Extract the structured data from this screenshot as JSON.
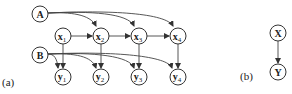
{
  "panels": [
    {
      "id": "a",
      "label": "(a)"
    },
    {
      "id": "b",
      "label": "(b)"
    }
  ],
  "nodes": {
    "A": {
      "text": "A",
      "sub": ""
    },
    "B": {
      "text": "B",
      "sub": ""
    },
    "x1": {
      "text": "x",
      "sub": "1"
    },
    "x2": {
      "text": "x",
      "sub": "2"
    },
    "x3": {
      "text": "x",
      "sub": "3"
    },
    "x4": {
      "text": "x",
      "sub": "4"
    },
    "y1": {
      "text": "y",
      "sub": "1"
    },
    "y2": {
      "text": "y",
      "sub": "2"
    },
    "y3": {
      "text": "y",
      "sub": "3"
    },
    "y4": {
      "text": "y",
      "sub": "4"
    },
    "X": {
      "text": "X",
      "sub": ""
    },
    "Y": {
      "text": "Y",
      "sub": ""
    }
  },
  "edges": [
    [
      "A",
      "x2"
    ],
    [
      "A",
      "x3"
    ],
    [
      "A",
      "x4"
    ],
    [
      "x1",
      "x2"
    ],
    [
      "x2",
      "x3"
    ],
    [
      "x3",
      "x4"
    ],
    [
      "x1",
      "y1"
    ],
    [
      "x2",
      "y2"
    ],
    [
      "x3",
      "y3"
    ],
    [
      "x4",
      "y4"
    ],
    [
      "B",
      "y1"
    ],
    [
      "B",
      "y2"
    ],
    [
      "B",
      "y3"
    ],
    [
      "B",
      "y4"
    ],
    [
      "X",
      "Y"
    ]
  ]
}
